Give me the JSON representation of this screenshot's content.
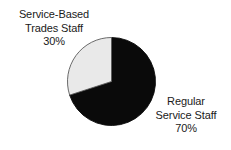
{
  "chart_data": {
    "type": "pie",
    "title": "",
    "subtitle": "",
    "xlabel": "",
    "ylabel": "",
    "grid": false,
    "legend_position": "outside-labels",
    "start_angle_deg": 90,
    "direction": "clockwise",
    "categories": [
      "Regular Service Staff",
      "Service-Based Trades Staff"
    ],
    "values": [
      70,
      30
    ],
    "value_unit": "%",
    "slices": [
      {
        "name": "Regular Service Staff",
        "value": 70,
        "percent_label": "70%",
        "color": "#0a0a0a",
        "stroke": "#0a0a0a",
        "label_lines": [
          "Regular",
          "Service Staff",
          "70%"
        ],
        "label_position": "right"
      },
      {
        "name": "Service-Based Trades Staff",
        "value": 30,
        "percent_label": "30%",
        "color": "#e9e9e9",
        "stroke": "#5a5a5a",
        "label_lines": [
          "Service-Based",
          "Trades Staff",
          "30%"
        ],
        "label_position": "upper-left"
      }
    ]
  },
  "labels": {
    "left": {
      "line1": "Service-Based",
      "line2": "Trades Staff",
      "line3": "30%"
    },
    "right": {
      "line1": "Regular",
      "line2": "Service Staff",
      "line3": "70%"
    }
  },
  "colors": {
    "background": "#ffffff",
    "text": "#1a1a1a",
    "slice_dark": "#0a0a0a",
    "slice_light": "#e9e9e9",
    "slice_outline": "#5a5a5a"
  }
}
